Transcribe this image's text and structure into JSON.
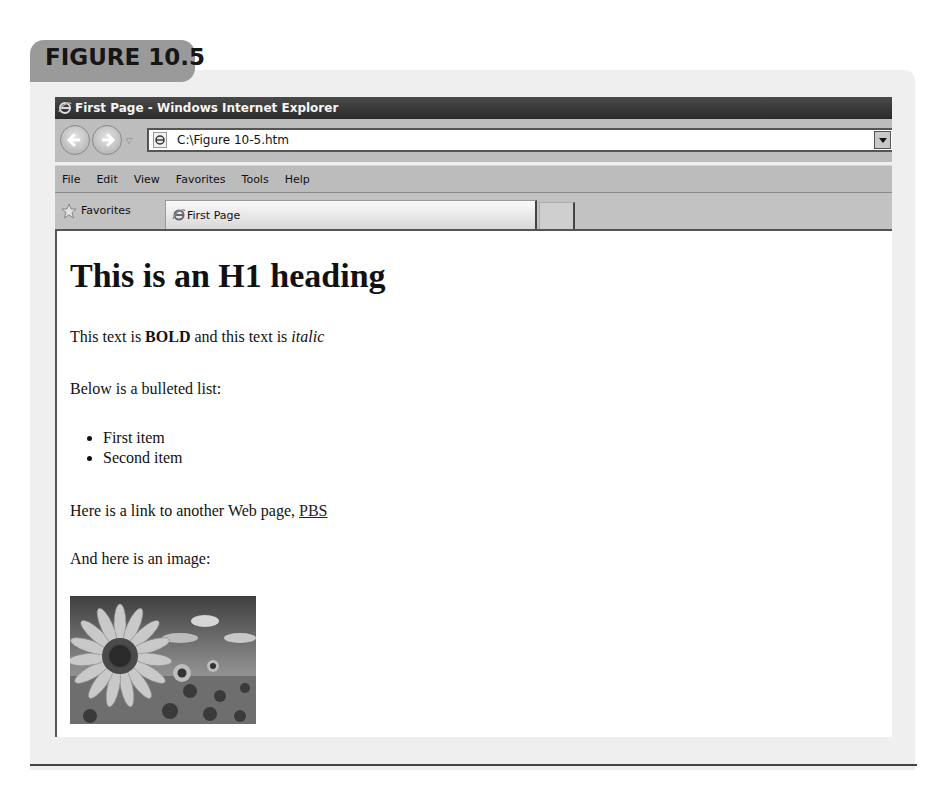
{
  "figure": {
    "label": "FIGURE 10.5"
  },
  "browser": {
    "window_title": "First Page - Windows Internet Explorer",
    "address": {
      "url": "C:\\Figure 10-5.htm"
    },
    "icons": {
      "back": "back-arrow-icon",
      "forward": "forward-arrow-icon",
      "recent_pages": "chevron-down-icon",
      "page": "ie-page-icon",
      "address_dropdown": "dropdown-arrow-icon",
      "favorites": "star-icon"
    },
    "menu": [
      "File",
      "Edit",
      "View",
      "Favorites",
      "Tools",
      "Help"
    ],
    "favorites_label": "Favorites",
    "tabs": [
      {
        "label": "First Page",
        "active": true
      }
    ]
  },
  "page": {
    "heading": "This is an H1 heading",
    "para1": {
      "before": "This text is ",
      "bold": "BOLD",
      "middle": " and this text is ",
      "italic": "italic"
    },
    "para2": "Below is a bulleted list:",
    "list_items": [
      "First item",
      "Second item"
    ],
    "para3": {
      "before": "Here is a link to another Web page, ",
      "link": "PBS"
    },
    "para4": "And here is an image:",
    "image": {
      "subject": "sunflower field under a blue sky with clouds"
    }
  }
}
